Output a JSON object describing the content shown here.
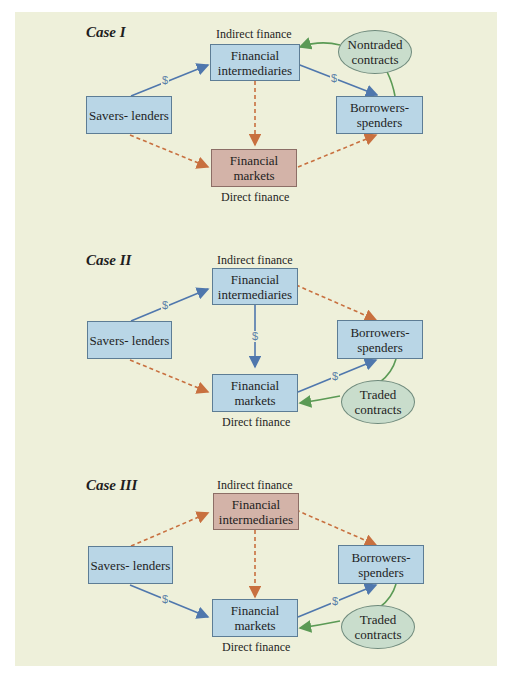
{
  "cases": [
    {
      "title": "Case I",
      "indirect_label": "Indirect finance",
      "direct_label": "Direct finance",
      "nodes": {
        "savers": "Savers- lenders",
        "intermediaries": "Financial intermediaries",
        "markets": "Financial markets",
        "borrowers": "Borrowers- spenders",
        "contracts": "Nontraded contracts"
      },
      "highlighted": "markets",
      "dollar": "$"
    },
    {
      "title": "Case II",
      "indirect_label": "Indirect finance",
      "direct_label": "Direct finance",
      "nodes": {
        "savers": "Savers- lenders",
        "intermediaries": "Financial intermediaries",
        "markets": "Financial markets",
        "borrowers": "Borrowers- spenders",
        "contracts": "Traded contracts"
      },
      "highlighted": "none",
      "dollar": "$"
    },
    {
      "title": "Case III",
      "indirect_label": "Indirect finance",
      "direct_label": "Direct finance",
      "nodes": {
        "savers": "Savers- lenders",
        "intermediaries": "Financial intermediaries",
        "markets": "Financial markets",
        "borrowers": "Borrowers- spenders",
        "contracts": "Traded contracts"
      },
      "highlighted": "intermediaries",
      "dollar": "$"
    }
  ],
  "colors": {
    "background": "#eef0da",
    "box_blue": "#b9d6e6",
    "box_highlight": "#d3b3a8",
    "contract_ellipse": "#c9ddcc",
    "money_arrow": "#4f77ad",
    "inactive_arrow": "#c8703f",
    "contract_arrow": "#5b9a55"
  }
}
